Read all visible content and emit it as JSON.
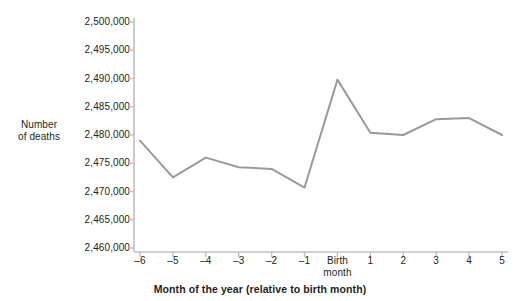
{
  "chart_data": {
    "type": "line",
    "title": "",
    "xlabel": "Month of the year (relative to birth month)",
    "ylabel": "Number of deaths",
    "ylabel_lines": [
      "Number",
      "of deaths"
    ],
    "categories": [
      "–6",
      "–5",
      "–4",
      "–3",
      "–2",
      "–1",
      "Birth\nmonth",
      "1",
      "2",
      "3",
      "4",
      "5"
    ],
    "x": [
      -6,
      -5,
      -4,
      -3,
      -2,
      -1,
      0,
      1,
      2,
      3,
      4,
      5
    ],
    "values": [
      2479000,
      2472500,
      2476000,
      2474300,
      2474000,
      2470700,
      2489800,
      2480400,
      2480000,
      2482800,
      2483000,
      2480000
    ],
    "ylim": [
      2460000,
      2500000
    ],
    "ytick_labels": [
      "2,500,000",
      "2,495,000",
      "2,490,000",
      "2,485,000",
      "2,480,000",
      "2,475,000",
      "2,470,000",
      "2,465,000",
      "2,460,000"
    ],
    "ytick_values": [
      2500000,
      2495000,
      2490000,
      2485000,
      2480000,
      2475000,
      2470000,
      2465000,
      2460000
    ],
    "grid": false,
    "legend": null,
    "legend_position": "none",
    "markers": false,
    "line_color": "#9a9a9a",
    "axis_color": "#bfbfbf",
    "text_color": "#231f20",
    "background": "#ffffff"
  }
}
